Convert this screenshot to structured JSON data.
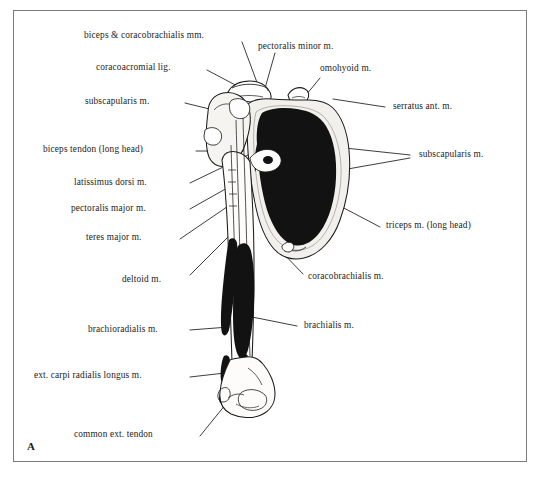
{
  "figure": {
    "panel_letter": "A",
    "frame_color": "#7c7c7c",
    "ink_color": "#1b1b1b",
    "fill_color": "#121212",
    "background": "#ffffff"
  },
  "labels": {
    "biceps_coracobrachialis": "biceps & coracobrachialis mm.",
    "coracoacromial_lig": "coracoacromial lig.",
    "pectoralis_minor": "pectoralis minor m.",
    "omohyoid": "omohyoid m.",
    "subscapularis_left": "subscapularis m.",
    "serratus_anterior": "serratus ant. m.",
    "biceps_tendon": "biceps tendon (long head)",
    "subscapularis_right": "subscapularis m.",
    "latissimus_dorsi": "latissimus dorsi m.",
    "pectoralis_major": "pectoralis major m.",
    "teres_major": "teres major m.",
    "triceps_long_head": "triceps m. (long head)",
    "deltoid": "deltoid m.",
    "coracobrachialis": "coracobrachialis m.",
    "brachioradialis": "brachioradialis m.",
    "brachialis": "brachialis m.",
    "ext_carpi_radialis_longus": "ext. carpi radialis longus m.",
    "common_ext_tendon": "common ext. tendon"
  }
}
